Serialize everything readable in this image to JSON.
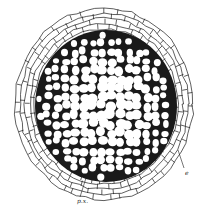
{
  "figure": {
    "width": 208,
    "height": 223,
    "background": "#ffffff",
    "ink": "#1a1a1a",
    "outer_region": {
      "cx": 104,
      "cy": 104,
      "rx": 89,
      "ry": 96,
      "cell_stroke": 0.7,
      "rings": 4
    },
    "inner_region": {
      "cx": 106,
      "cy": 106,
      "rx": 71,
      "ry": 76,
      "cell_stroke": 2.6
    }
  },
  "labels": [
    {
      "id": "px",
      "text": "p.x.",
      "x": 77,
      "y": 198,
      "leader": [
        [
          80,
          197
        ],
        [
          86,
          178
        ]
      ]
    },
    {
      "id": "e",
      "text": "e",
      "x": 185,
      "y": 170,
      "leader": [
        [
          184,
          168
        ],
        [
          178,
          150
        ]
      ]
    }
  ]
}
